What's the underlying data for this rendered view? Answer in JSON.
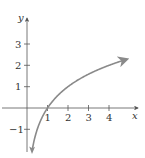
{
  "chart_data": {
    "type": "line",
    "title": "",
    "xlabel": "x",
    "ylabel": "y",
    "x_ticks": [
      "1",
      "2",
      "3",
      "4"
    ],
    "y_ticks": [
      "-1",
      "1",
      "2",
      "3"
    ],
    "xlim": [
      -1.3,
      5.3
    ],
    "ylim": [
      -2.2,
      3.9
    ],
    "grid": false,
    "series": [
      {
        "name": "y = log2(x)",
        "color": "#8a8a8a",
        "x": [
          0.25,
          0.35,
          0.5,
          0.7,
          1,
          1.5,
          2,
          2.5,
          3,
          3.5,
          4,
          4.5,
          4.9
        ],
        "y": [
          -2,
          -1.51,
          -1,
          -0.51,
          0,
          0.58,
          1,
          1.32,
          1.58,
          1.81,
          2,
          2.17,
          2.29
        ],
        "arrow_ends": true
      }
    ]
  },
  "labels": {
    "x_axis": "x",
    "y_axis": "y",
    "x_tick_1": "1",
    "x_tick_2": "2",
    "x_tick_3": "3",
    "x_tick_4": "4",
    "y_tick_3": "3",
    "y_tick_2": "2",
    "y_tick_1": "1",
    "y_tick_neg1": "−1"
  },
  "colors": {
    "axis": "#555555",
    "curve": "#8a8a8a"
  }
}
